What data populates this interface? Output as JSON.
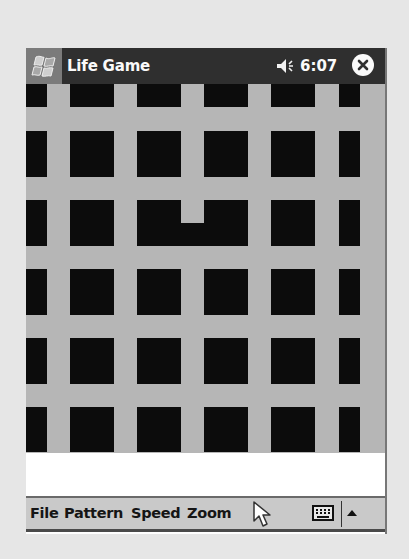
{
  "titlebar": {
    "start_icon": "windows-flag-icon",
    "app_title": "Life Game",
    "volume_icon": "speaker-icon",
    "clock": "6:07",
    "close_icon": "close-icon"
  },
  "grid": {
    "background": "#b6b6b6",
    "cell_color": "#0c0c0c",
    "cells": [
      {
        "x": 0,
        "y": 0,
        "w": 21,
        "h": 23
      },
      {
        "x": 44,
        "y": 0,
        "w": 44,
        "h": 23
      },
      {
        "x": 111,
        "y": 0,
        "w": 44,
        "h": 23
      },
      {
        "x": 178,
        "y": 0,
        "w": 44,
        "h": 23
      },
      {
        "x": 245,
        "y": 0,
        "w": 44,
        "h": 23
      },
      {
        "x": 313,
        "y": 0,
        "w": 21,
        "h": 23
      },
      {
        "x": 0,
        "y": 47,
        "w": 21,
        "h": 46
      },
      {
        "x": 44,
        "y": 47,
        "w": 44,
        "h": 46
      },
      {
        "x": 111,
        "y": 47,
        "w": 44,
        "h": 46
      },
      {
        "x": 178,
        "y": 47,
        "w": 44,
        "h": 46
      },
      {
        "x": 245,
        "y": 47,
        "w": 44,
        "h": 46
      },
      {
        "x": 313,
        "y": 47,
        "w": 21,
        "h": 46
      },
      {
        "x": 0,
        "y": 116,
        "w": 21,
        "h": 46
      },
      {
        "x": 44,
        "y": 116,
        "w": 44,
        "h": 46
      },
      {
        "x": 111,
        "y": 116,
        "w": 44,
        "h": 46
      },
      {
        "x": 155,
        "y": 139,
        "w": 23,
        "h": 23
      },
      {
        "x": 178,
        "y": 116,
        "w": 44,
        "h": 46
      },
      {
        "x": 245,
        "y": 116,
        "w": 44,
        "h": 46
      },
      {
        "x": 313,
        "y": 116,
        "w": 21,
        "h": 46
      },
      {
        "x": 0,
        "y": 185,
        "w": 21,
        "h": 46
      },
      {
        "x": 44,
        "y": 185,
        "w": 44,
        "h": 46
      },
      {
        "x": 111,
        "y": 185,
        "w": 44,
        "h": 46
      },
      {
        "x": 178,
        "y": 185,
        "w": 44,
        "h": 46
      },
      {
        "x": 245,
        "y": 185,
        "w": 44,
        "h": 46
      },
      {
        "x": 313,
        "y": 185,
        "w": 21,
        "h": 46
      },
      {
        "x": 0,
        "y": 254,
        "w": 21,
        "h": 46
      },
      {
        "x": 44,
        "y": 254,
        "w": 44,
        "h": 46
      },
      {
        "x": 111,
        "y": 254,
        "w": 44,
        "h": 46
      },
      {
        "x": 178,
        "y": 254,
        "w": 44,
        "h": 46
      },
      {
        "x": 245,
        "y": 254,
        "w": 44,
        "h": 46
      },
      {
        "x": 313,
        "y": 254,
        "w": 21,
        "h": 46
      },
      {
        "x": 0,
        "y": 323,
        "w": 21,
        "h": 45
      },
      {
        "x": 44,
        "y": 323,
        "w": 44,
        "h": 45
      },
      {
        "x": 111,
        "y": 323,
        "w": 44,
        "h": 45
      },
      {
        "x": 178,
        "y": 323,
        "w": 44,
        "h": 45
      },
      {
        "x": 245,
        "y": 323,
        "w": 44,
        "h": 45
      },
      {
        "x": 313,
        "y": 323,
        "w": 21,
        "h": 45
      }
    ]
  },
  "menubar": {
    "items": [
      {
        "label": "File",
        "x": 4
      },
      {
        "label": "Pattern",
        "x": 38
      },
      {
        "label": "Speed",
        "x": 105
      },
      {
        "label": "Zoom",
        "x": 161
      }
    ],
    "keyboard_icon": "keyboard-icon",
    "sip_arrow_icon": "up-arrow-icon"
  }
}
